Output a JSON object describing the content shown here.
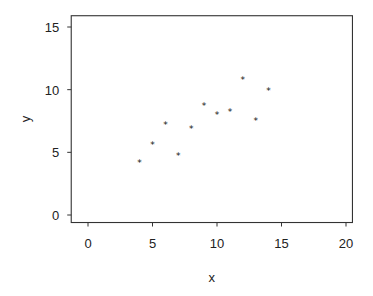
{
  "chart_data": {
    "type": "scatter",
    "title": "",
    "xlabel": "x",
    "ylabel": "y",
    "xlim": [
      -1.3,
      20.5
    ],
    "ylim": [
      -0.6,
      15.9
    ],
    "xticks": [
      0,
      5,
      10,
      15,
      20
    ],
    "yticks": [
      0,
      5,
      10,
      15
    ],
    "xtick_labels": [
      "0",
      "5",
      "10",
      "15",
      "20"
    ],
    "ytick_labels": [
      "0",
      "5",
      "10",
      "15"
    ],
    "grid": false,
    "legend": null,
    "marker": "*",
    "color": "#111111",
    "points": [
      {
        "x": 4,
        "y": 4.26
      },
      {
        "x": 5,
        "y": 5.68
      },
      {
        "x": 6,
        "y": 7.24
      },
      {
        "x": 7,
        "y": 4.82
      },
      {
        "x": 8,
        "y": 6.95
      },
      {
        "x": 9,
        "y": 8.81
      },
      {
        "x": 10,
        "y": 8.04
      },
      {
        "x": 11,
        "y": 8.33
      },
      {
        "x": 12,
        "y": 10.84
      },
      {
        "x": 13,
        "y": 7.58
      },
      {
        "x": 14,
        "y": 9.96
      }
    ]
  }
}
